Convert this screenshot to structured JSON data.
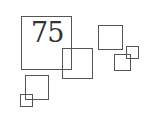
{
  "diagram": {
    "label": "75",
    "stroke_color": "#555555",
    "text_color": "#333333",
    "squares": [
      {
        "id": "large-square",
        "x": 21,
        "y": 16,
        "w": 51,
        "h": 54
      },
      {
        "id": "medium-square-center",
        "x": 62,
        "y": 48,
        "w": 31,
        "h": 31
      },
      {
        "id": "square-top-right",
        "x": 98,
        "y": 25,
        "w": 25,
        "h": 25
      },
      {
        "id": "square-right-lower",
        "x": 114,
        "y": 54,
        "w": 17,
        "h": 17
      },
      {
        "id": "square-right-small",
        "x": 126,
        "y": 46,
        "w": 13,
        "h": 13
      },
      {
        "id": "square-bottom-left",
        "x": 25,
        "y": 75,
        "w": 24,
        "h": 25
      },
      {
        "id": "square-bottom-left-small",
        "x": 20,
        "y": 94,
        "w": 13,
        "h": 13
      }
    ]
  }
}
